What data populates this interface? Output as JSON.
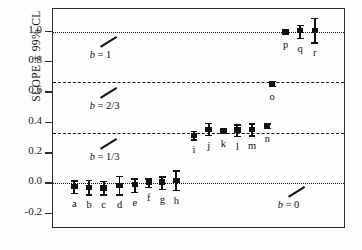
{
  "chart_data": {
    "type": "scatter",
    "title": "",
    "xlabel": "",
    "ylabel": "SLOPE ± 99% CL",
    "ylim": [
      -0.3,
      1.15
    ],
    "yticks": [
      -0.2,
      0.0,
      0.2,
      0.4,
      0.6,
      0.8,
      1.0
    ],
    "ytick_labels": [
      "-0.2",
      "0.0",
      "0.2",
      "0.4",
      "0.6",
      "0.8",
      "1.0"
    ],
    "xlim": [
      0,
      24
    ],
    "xticks": [],
    "grid": false,
    "legend": "none",
    "reference_lines": [
      {
        "y": 1.0,
        "style": "dotted",
        "label": "b = 1",
        "label_x": 3.0,
        "label_y": 0.845
      },
      {
        "y": 0.667,
        "style": "dashed",
        "label": "b = 2/3",
        "label_x": 3.0,
        "label_y": 0.508
      },
      {
        "y": 0.333,
        "style": "dashed",
        "label": "b = 1/3",
        "label_x": 3.0,
        "label_y": 0.172
      },
      {
        "y": 0.0,
        "style": "dotted",
        "label": "b = 0",
        "label_x": 18.4,
        "label_y": -0.143
      }
    ],
    "error_bar_type": "99% confidence limits",
    "marker": "square",
    "points": [
      {
        "label": "a",
        "x": 1.75,
        "y": -0.02,
        "ci_low": -0.062,
        "ci_high": 0.02
      },
      {
        "label": "b",
        "x": 2.95,
        "y": -0.026,
        "ci_low": -0.072,
        "ci_high": 0.026
      },
      {
        "label": "c",
        "x": 4.15,
        "y": -0.03,
        "ci_low": -0.072,
        "ci_high": 0.018
      },
      {
        "label": "d",
        "x": 5.45,
        "y": -0.012,
        "ci_low": -0.07,
        "ci_high": 0.05
      },
      {
        "label": "e",
        "x": 6.7,
        "y": -0.008,
        "ci_low": -0.054,
        "ci_high": 0.036
      },
      {
        "label": "f",
        "x": 7.85,
        "y": 0.008,
        "ci_low": -0.022,
        "ci_high": 0.036
      },
      {
        "label": "g",
        "x": 8.95,
        "y": 0.01,
        "ci_low": -0.034,
        "ci_high": 0.048
      },
      {
        "label": "h",
        "x": 10.1,
        "y": 0.02,
        "ci_low": -0.042,
        "ci_high": 0.086
      },
      {
        "label": "i",
        "x": 11.55,
        "y": 0.318,
        "ci_low": 0.292,
        "ci_high": 0.348
      },
      {
        "label": "j",
        "x": 12.75,
        "y": 0.355,
        "ci_low": 0.32,
        "ci_high": 0.4
      },
      {
        "label": "k",
        "x": 13.95,
        "y": 0.35,
        "ci_low": 0.334,
        "ci_high": 0.368
      },
      {
        "label": "l",
        "x": 15.1,
        "y": 0.352,
        "ci_low": 0.316,
        "ci_high": 0.392
      },
      {
        "label": "m",
        "x": 16.3,
        "y": 0.356,
        "ci_low": 0.318,
        "ci_high": 0.396
      },
      {
        "label": "n",
        "x": 17.55,
        "y": 0.382,
        "ci_low": 0.368,
        "ci_high": 0.396
      },
      {
        "label": "o",
        "x": 17.95,
        "y": 0.66,
        "ci_low": 0.644,
        "ci_high": 0.678
      },
      {
        "label": "p",
        "x": 19.05,
        "y": 1.0,
        "ci_low": 0.986,
        "ci_high": 1.014
      },
      {
        "label": "q",
        "x": 20.25,
        "y": 1.006,
        "ci_low": 0.962,
        "ci_high": 1.046
      },
      {
        "label": "r",
        "x": 21.45,
        "y": 1.01,
        "ci_low": 0.93,
        "ci_high": 1.092
      }
    ]
  }
}
